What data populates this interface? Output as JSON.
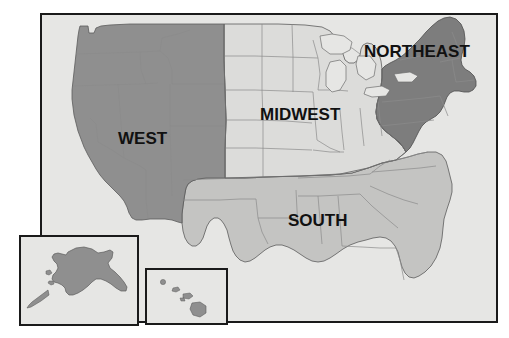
{
  "figure": {
    "kind": "map",
    "background_color": "#ffffff"
  },
  "map": {
    "frame": {
      "x": 40,
      "y": 13,
      "width": 458,
      "height": 310,
      "border_color": "#1a1a1a",
      "border_width": 2,
      "ocean_color": "#e6e6e4"
    },
    "regions": [
      {
        "id": "west",
        "label": "WEST",
        "fill": "#8f8f8f",
        "label_x": 118,
        "label_y": 144,
        "label_size": 17
      },
      {
        "id": "midwest",
        "label": "MIDWEST",
        "fill": "#dcdcda",
        "label_x": 260,
        "label_y": 120,
        "label_size": 17
      },
      {
        "id": "south",
        "label": "SOUTH",
        "fill": "#c4c4c2",
        "label_x": 288,
        "label_y": 226,
        "label_size": 17
      },
      {
        "id": "northeast",
        "label": "NORTHEAST",
        "fill": "#7d7d7d",
        "label_x": 364,
        "label_y": 57,
        "label_size": 17
      }
    ],
    "insets": [
      {
        "id": "alaska",
        "name": "Alaska inset",
        "x": 19,
        "y": 235,
        "width": 120,
        "height": 91,
        "fill": "#e6e6e4",
        "land_fill": "#8f8f8f",
        "border_color": "#1a1a1a",
        "border_width": 2
      },
      {
        "id": "hawaii",
        "name": "Hawaii inset",
        "x": 145,
        "y": 268,
        "width": 83,
        "height": 57,
        "fill": "#e6e6e4",
        "land_fill": "#8f8f8f",
        "border_color": "#1a1a1a",
        "border_width": 2
      }
    ],
    "colors": {
      "state_border": "#8b8b8b",
      "region_border": "#6d6d6d",
      "coastline": "#5c5c5c",
      "label_text": "#111111"
    }
  }
}
